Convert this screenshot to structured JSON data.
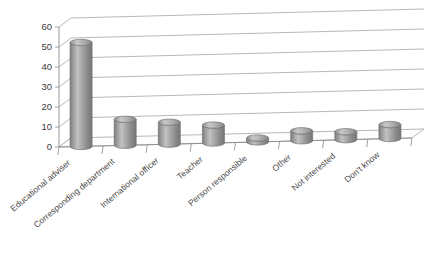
{
  "chart_data": {
    "type": "bar",
    "title": "",
    "subtitle": "",
    "xlabel": "",
    "ylabel": "",
    "categories": [
      "Educational adviser",
      "Corresponding department",
      "International officer",
      "Teacher",
      "Person responsible",
      "Other",
      "Not interested",
      "Don't know"
    ],
    "values": [
      52,
      13,
      11,
      9,
      2,
      5,
      4,
      7
    ],
    "ylim": [
      0,
      60
    ],
    "yticks": [
      0,
      10,
      20,
      30,
      40,
      50,
      60
    ],
    "ytick_labels": [
      "0",
      "10",
      "20",
      "30",
      "40",
      "50",
      "60"
    ],
    "grid": true,
    "legend": "none",
    "style": "3d-cylinder",
    "bar_color": "#8f8f8f",
    "bar_color_light": "#bcbcbc",
    "bar_color_dark": "#6f6f6f",
    "grid_color": "#9a9a9a",
    "background_color": "#ffffff",
    "text_color": "#3a3a3a",
    "label_rotation_deg": -40
  }
}
